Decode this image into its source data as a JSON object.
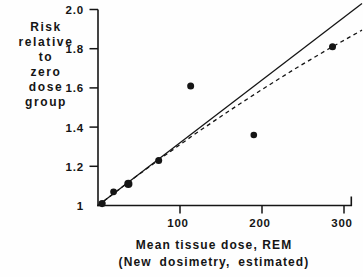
{
  "chart_data": {
    "type": "scatter",
    "title": "",
    "ylabel_lines": [
      "Risk",
      "relative",
      "to",
      "zero",
      "dose",
      "group"
    ],
    "xlabel_lines": [
      "Mean tissue dose, REM",
      "(New dosimetry, estimated)"
    ],
    "y_ticks": [
      {
        "value": 2.0,
        "label": "2.0"
      },
      {
        "value": 1.8,
        "label": "1.8"
      },
      {
        "value": 1.6,
        "label": "1.6"
      },
      {
        "value": 1.4,
        "label": "1.4"
      },
      {
        "value": 1.2,
        "label": "1.2"
      },
      {
        "value": 1.0,
        "label": "1"
      }
    ],
    "x_ticks": [
      {
        "value": 100,
        "label": "100"
      },
      {
        "value": 200,
        "label": "200"
      },
      {
        "value": 300,
        "label": "300"
      }
    ],
    "xlim": [
      0,
      323
    ],
    "ylim": [
      1.0,
      2.0
    ],
    "grid": false,
    "legend": null,
    "ink_color": "#151515",
    "points": [
      {
        "dose": 5,
        "risk": 1.01,
        "r": 3.6
      },
      {
        "dose": 19,
        "risk": 1.07,
        "r": 3.4
      },
      {
        "dose": 37,
        "risk": 1.11,
        "r": 4.1
      },
      {
        "dose": 74,
        "risk": 1.23,
        "r": 3.5
      },
      {
        "dose": 113,
        "risk": 1.61,
        "r": 3.5
      },
      {
        "dose": 190,
        "risk": 1.36,
        "r": 3.3
      },
      {
        "dose": 286,
        "risk": 1.81,
        "r": 3.5
      }
    ],
    "lines": [
      {
        "name": "solid-linear-fit",
        "style": "solid",
        "points": [
          [
            0,
            1.0
          ],
          [
            322,
            2.03
          ]
        ]
      },
      {
        "name": "dashed-fit",
        "style": "dashed",
        "points": [
          [
            0,
            1.0
          ],
          [
            40,
            1.128
          ],
          [
            80,
            1.251
          ],
          [
            120,
            1.37
          ],
          [
            160,
            1.483
          ],
          [
            200,
            1.592
          ],
          [
            240,
            1.697
          ],
          [
            280,
            1.796
          ],
          [
            322,
            1.895
          ]
        ]
      }
    ]
  }
}
